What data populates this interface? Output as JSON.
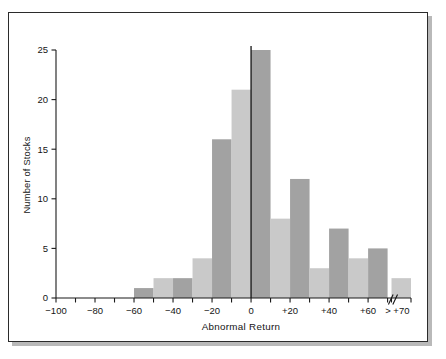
{
  "chart_data": {
    "type": "bar",
    "title": "",
    "xlabel": "Abnormal Return",
    "ylabel": "Number of Stocks",
    "xlim": [
      -100,
      80
    ],
    "ylim": [
      0,
      25
    ],
    "grid": false,
    "legend": null,
    "x_tick_labels": [
      "−100",
      "−80",
      "−60",
      "−40",
      "−20",
      "0",
      "+20",
      "+40",
      "+60",
      "> +70"
    ],
    "x_tick_values": [
      -100,
      -80,
      -60,
      -40,
      -20,
      0,
      20,
      40,
      60,
      75
    ],
    "x_minor_tick_step": 10,
    "y_tick_labels": [
      "0",
      "5",
      "10",
      "15",
      "20",
      "25"
    ],
    "y_tick_values": [
      0,
      5,
      10,
      15,
      20,
      25
    ],
    "bin_width": 10,
    "axis_break": {
      "label": "//",
      "after_value": 70
    },
    "zero_reference_line": true,
    "colors": {
      "dark_bar": "#a2a2a2",
      "light_bar": "#c9c9c9",
      "axis": "#141414",
      "frame": "#2b2b2b",
      "background": "#ffffff"
    },
    "bins": [
      {
        "start": -100,
        "end": -90,
        "value": 0,
        "shade": "light"
      },
      {
        "start": -90,
        "end": -80,
        "value": 0,
        "shade": "dark"
      },
      {
        "start": -80,
        "end": -70,
        "value": 0,
        "shade": "light"
      },
      {
        "start": -70,
        "end": -60,
        "value": 0,
        "shade": "dark"
      },
      {
        "start": -60,
        "end": -50,
        "value": 1,
        "shade": "dark"
      },
      {
        "start": -50,
        "end": -40,
        "value": 2,
        "shade": "light"
      },
      {
        "start": -40,
        "end": -30,
        "value": 2,
        "shade": "dark"
      },
      {
        "start": -30,
        "end": -20,
        "value": 4,
        "shade": "light"
      },
      {
        "start": -20,
        "end": -10,
        "value": 16,
        "shade": "dark"
      },
      {
        "start": -10,
        "end": 0,
        "value": 21,
        "shade": "light"
      },
      {
        "start": 0,
        "end": 10,
        "value": 25,
        "shade": "dark"
      },
      {
        "start": 10,
        "end": 20,
        "value": 8,
        "shade": "light"
      },
      {
        "start": 20,
        "end": 30,
        "value": 12,
        "shade": "dark"
      },
      {
        "start": 30,
        "end": 40,
        "value": 3,
        "shade": "light"
      },
      {
        "start": 40,
        "end": 50,
        "value": 7,
        "shade": "dark"
      },
      {
        "start": 50,
        "end": 60,
        "value": 4,
        "shade": "light"
      },
      {
        "start": 60,
        "end": 70,
        "value": 5,
        "shade": "dark"
      },
      {
        "start": 72,
        "end": 82,
        "value": 2,
        "shade": "light",
        "label": "> +70"
      }
    ]
  }
}
